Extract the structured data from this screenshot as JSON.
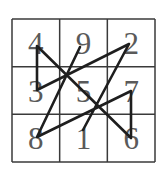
{
  "diagram": {
    "type": "magic-square-path",
    "grid": {
      "rows": 3,
      "cols": 3,
      "left": 12,
      "top": 19,
      "right": 155,
      "bottom": 162,
      "line_color": "#3a3a3a"
    },
    "cells": [
      [
        "4",
        "9",
        "2"
      ],
      [
        "3",
        "5",
        "7"
      ],
      [
        "8",
        "1",
        "6"
      ]
    ],
    "path_color": "#1e1e1e",
    "path_order": [
      "1",
      "2",
      "3",
      "4",
      "5",
      "6",
      "7",
      "8",
      "9"
    ],
    "path_points": [
      {
        "label": "1",
        "x": 83,
        "y": 130
      },
      {
        "label": "2",
        "x": 129,
        "y": 44
      },
      {
        "label": "3",
        "x": 37,
        "y": 90
      },
      {
        "label": "4",
        "x": 37,
        "y": 46
      },
      {
        "label": "6",
        "x": 131,
        "y": 138
      },
      {
        "label": "7",
        "x": 131,
        "y": 91
      },
      {
        "label": "8",
        "x": 37,
        "y": 137
      },
      {
        "label": "9",
        "x": 80,
        "y": 47
      }
    ]
  }
}
